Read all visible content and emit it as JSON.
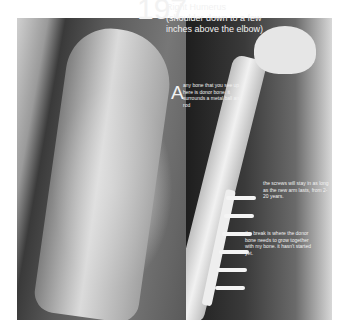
{
  "figure": {
    "number": "197",
    "title": "Right Humerus (shoulder down to a few inches above the elbow)",
    "panel_label": "A",
    "annotations": [
      "any bone that you see up here is donor bone. it surrounds a metal ball and rod",
      "the screws will stay in as long as the new arm lasts, from 2-20 years.",
      "the break is where the donor bone needs to grow together with my bone. it hasn't started yet."
    ]
  }
}
